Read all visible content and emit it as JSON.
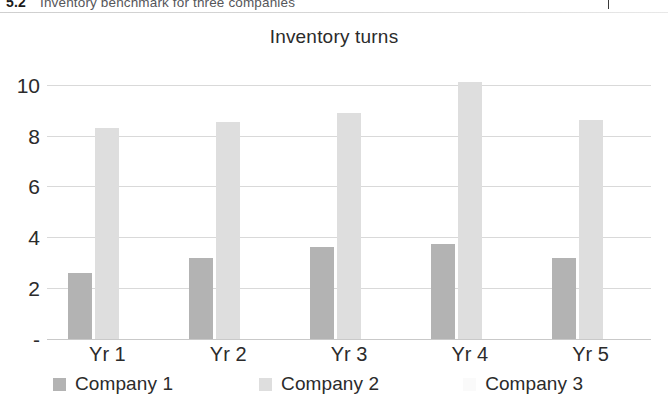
{
  "caption": {
    "number": "5.2",
    "text": "Inventory benchmark for three companies"
  },
  "chart_data": {
    "type": "bar",
    "title": "Inventory turns",
    "xlabel": "",
    "ylabel": "",
    "categories": [
      "Yr 1",
      "Yr 2",
      "Yr 3",
      "Yr 4",
      "Yr 5"
    ],
    "series": [
      {
        "name": "Company 1",
        "color": "#b3b3b3",
        "values": [
          2.6,
          3.2,
          3.6,
          3.75,
          3.2
        ]
      },
      {
        "name": "Company 2",
        "color": "#dedede",
        "values": [
          8.3,
          8.55,
          8.9,
          10.1,
          8.6
        ]
      },
      {
        "name": "Company 3",
        "color": "#fafafa",
        "values": [
          0.0,
          0.0,
          0.0,
          0.0,
          0.0
        ]
      }
    ],
    "ylim": [
      0,
      10.5
    ],
    "yticks": [
      0,
      2,
      4,
      6,
      8,
      10
    ],
    "ytick_labels": [
      "-",
      "2",
      "4",
      "6",
      "8",
      "10"
    ],
    "grid": true,
    "legend_position": "bottom"
  },
  "colors": {
    "gridline": "#d9d9d9",
    "text": "#2b2b2b",
    "background": "#ffffff"
  }
}
